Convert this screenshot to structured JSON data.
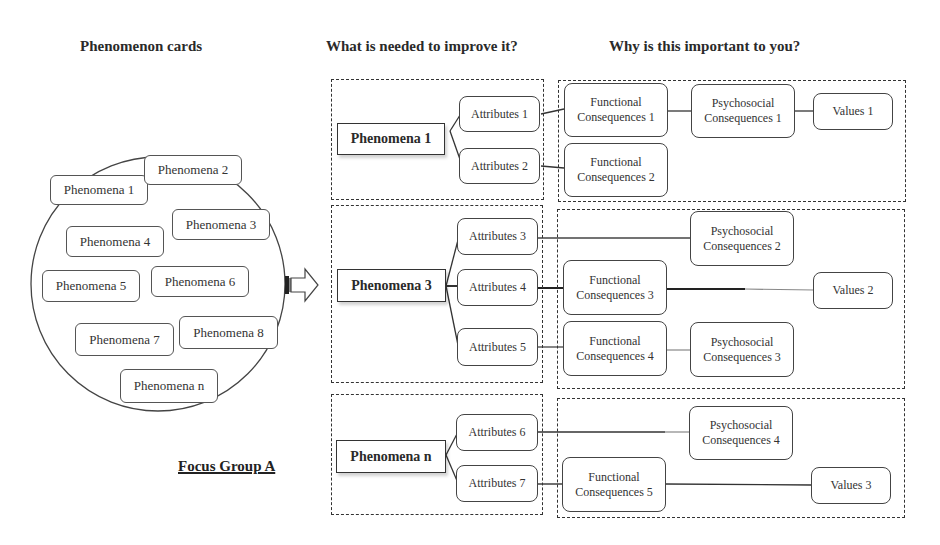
{
  "headings": {
    "phenomenon_cards": "Phenomenon cards",
    "improve": "What is needed to improve it?",
    "important": "Why is this important to you?"
  },
  "focus_group": "Focus Group A",
  "cards": [
    "Phenomena 1",
    "Phenomena 2",
    "Phenomena 3",
    "Phenomena 4",
    "Phenomena 5",
    "Phenomena 6",
    "Phenomena 7",
    "Phenomena 8",
    "Phenomena n"
  ],
  "groups": [
    {
      "phenomenon": "Phenomena 1",
      "attributes": [
        "Attributes 1",
        "Attributes 2"
      ],
      "functional": [
        {
          "line1": "Functional",
          "line2": "Consequences 1"
        },
        {
          "line1": "Functional",
          "line2": "Consequences 2"
        }
      ],
      "psychosocial": [
        {
          "line1": "Psychosocial",
          "line2": "Consequences 1"
        }
      ],
      "values": [
        "Values 1"
      ]
    },
    {
      "phenomenon": "Phenomena 3",
      "attributes": [
        "Attributes 3",
        "Attributes 4",
        "Attributes 5"
      ],
      "functional": [
        {
          "line1": "Functional",
          "line2": "Consequences 3"
        },
        {
          "line1": "Functional",
          "line2": "Consequences 4"
        }
      ],
      "psychosocial": [
        {
          "line1": "Psychosocial",
          "line2": "Consequences 2"
        },
        {
          "line1": "Psychosocial",
          "line2": "Consequences 3"
        }
      ],
      "values": [
        "Values 2"
      ]
    },
    {
      "phenomenon": "Phenomena n",
      "attributes": [
        "Attributes 6",
        "Attributes 7"
      ],
      "functional": [
        {
          "line1": "Functional",
          "line2": "Consequences 5"
        }
      ],
      "psychosocial": [
        {
          "line1": "Psychosocial",
          "line2": "Consequences 4"
        }
      ],
      "values": [
        "Values 3"
      ]
    }
  ],
  "colors": {
    "line": "#333333",
    "background": "#ffffff"
  }
}
